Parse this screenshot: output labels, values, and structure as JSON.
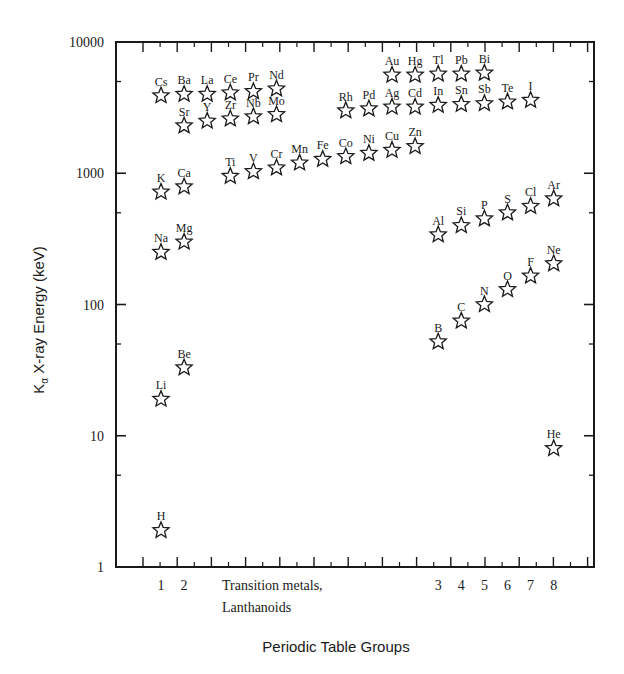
{
  "chart_data": {
    "type": "scatter",
    "title": "",
    "xlabel": "Periodic Table Groups",
    "ylabel": "Kα X-ray Energy (keV)",
    "ylabel_parts": {
      "base": "K",
      "sub": "α",
      "rest": " X-ray Energy (keV)"
    },
    "yscale": "log",
    "ylim": [
      1,
      10000
    ],
    "yticks": [
      1,
      10,
      100,
      1000,
      10000
    ],
    "ytick_labels": [
      "1",
      "10",
      "100",
      "1000",
      "10000"
    ],
    "grid": false,
    "legend": null,
    "marker": "open-star",
    "x_group_labels": [
      {
        "label": "1",
        "column": 1
      },
      {
        "label": "2",
        "column": 2
      },
      {
        "label": "Transition metals,",
        "column": 4,
        "line": 1
      },
      {
        "label": "Lanthanoids",
        "column": 4,
        "line": 2
      },
      {
        "label": "3",
        "column": 13
      },
      {
        "label": "4",
        "column": 14
      },
      {
        "label": "5",
        "column": 15
      },
      {
        "label": "6",
        "column": 16
      },
      {
        "label": "7",
        "column": 17
      },
      {
        "label": "8",
        "column": 18
      }
    ],
    "points": [
      {
        "element": "H",
        "column": 1,
        "value": 1.9
      },
      {
        "element": "Li",
        "column": 1,
        "value": 19
      },
      {
        "element": "Na",
        "column": 1,
        "value": 250
      },
      {
        "element": "K",
        "column": 1,
        "value": 720
      },
      {
        "element": "Cs",
        "column": 1,
        "value": 3900
      },
      {
        "element": "Be",
        "column": 2,
        "value": 33
      },
      {
        "element": "Mg",
        "column": 2,
        "value": 300
      },
      {
        "element": "Ca",
        "column": 2,
        "value": 790
      },
      {
        "element": "Sr",
        "column": 2,
        "value": 2300
      },
      {
        "element": "Ba",
        "column": 2,
        "value": 4000
      },
      {
        "element": "La",
        "column": 3,
        "value": 4000
      },
      {
        "element": "Y",
        "column": 3,
        "value": 2500
      },
      {
        "element": "Ce",
        "column": 4,
        "value": 4100
      },
      {
        "element": "Zr",
        "column": 4,
        "value": 2600
      },
      {
        "element": "Ti",
        "column": 4,
        "value": 950
      },
      {
        "element": "Pr",
        "column": 5,
        "value": 4200
      },
      {
        "element": "Nb",
        "column": 5,
        "value": 2700
      },
      {
        "element": "V",
        "column": 5,
        "value": 1030
      },
      {
        "element": "Nd",
        "column": 6,
        "value": 4400
      },
      {
        "element": "Mo",
        "column": 6,
        "value": 2800
      },
      {
        "element": "Cr",
        "column": 6,
        "value": 1100
      },
      {
        "element": "Mn",
        "column": 7,
        "value": 1200
      },
      {
        "element": "Fe",
        "column": 8,
        "value": 1280
      },
      {
        "element": "Rh",
        "column": 9,
        "value": 3000
      },
      {
        "element": "Co",
        "column": 9,
        "value": 1340
      },
      {
        "element": "Pd",
        "column": 10,
        "value": 3100
      },
      {
        "element": "Ni",
        "column": 10,
        "value": 1420
      },
      {
        "element": "Au",
        "column": 11,
        "value": 5600
      },
      {
        "element": "Ag",
        "column": 11,
        "value": 3200
      },
      {
        "element": "Cu",
        "column": 11,
        "value": 1500
      },
      {
        "element": "Hg",
        "column": 12,
        "value": 5600
      },
      {
        "element": "Cd",
        "column": 12,
        "value": 3200
      },
      {
        "element": "Zn",
        "column": 12,
        "value": 1600
      },
      {
        "element": "Tl",
        "column": 13,
        "value": 5700
      },
      {
        "element": "In",
        "column": 13,
        "value": 3300
      },
      {
        "element": "Al",
        "column": 13,
        "value": 340
      },
      {
        "element": "B",
        "column": 13,
        "value": 52
      },
      {
        "element": "Pb",
        "column": 14,
        "value": 5700
      },
      {
        "element": "Sn",
        "column": 14,
        "value": 3350
      },
      {
        "element": "Si",
        "column": 14,
        "value": 400
      },
      {
        "element": "C",
        "column": 14,
        "value": 75
      },
      {
        "element": "Bi",
        "column": 15,
        "value": 5800
      },
      {
        "element": "Sb",
        "column": 15,
        "value": 3400
      },
      {
        "element": "P",
        "column": 15,
        "value": 450
      },
      {
        "element": "N",
        "column": 15,
        "value": 100
      },
      {
        "element": "Te",
        "column": 16,
        "value": 3500
      },
      {
        "element": "S",
        "column": 16,
        "value": 500
      },
      {
        "element": "O",
        "column": 16,
        "value": 130
      },
      {
        "element": "I",
        "column": 17,
        "value": 3600
      },
      {
        "element": "Cl",
        "column": 17,
        "value": 560
      },
      {
        "element": "F",
        "column": 17,
        "value": 165
      },
      {
        "element": "Ar",
        "column": 18,
        "value": 640
      },
      {
        "element": "Ne",
        "column": 18,
        "value": 205
      },
      {
        "element": "He",
        "column": 18,
        "value": 8
      }
    ]
  },
  "colors": {
    "ink": "#1a1a1a",
    "background": "#ffffff"
  }
}
